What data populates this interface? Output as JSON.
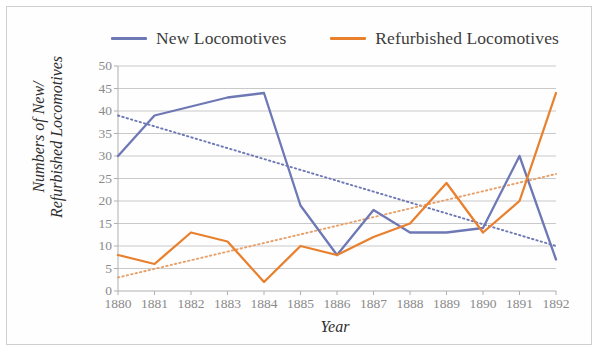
{
  "chart_data": {
    "type": "line",
    "title": "",
    "xlabel": "Year",
    "ylabel_line1": "Numbers of New/",
    "ylabel_line2": "Refurbished Locomotives",
    "categories": [
      "1880",
      "1881",
      "1882",
      "1883",
      "1884",
      "1885",
      "1886",
      "1887",
      "1888",
      "1889",
      "1890",
      "1891",
      "1892"
    ],
    "x": [
      1880,
      1881,
      1882,
      1883,
      1884,
      1885,
      1886,
      1887,
      1888,
      1889,
      1890,
      1891,
      1892
    ],
    "xlim": [
      1880,
      1892
    ],
    "ylim": [
      0,
      50
    ],
    "yticks": [
      0,
      5,
      10,
      15,
      20,
      25,
      30,
      35,
      40,
      45,
      50
    ],
    "ytick_labels": [
      "0",
      "5",
      "10",
      "15",
      "20",
      "25",
      "30",
      "35",
      "40",
      "45",
      "50"
    ],
    "grid": "horizontal",
    "legend_position": "top-center",
    "series": [
      {
        "name": "New Locomotives",
        "color": "#6d78b5",
        "style": "solid",
        "values": [
          30,
          39,
          41,
          43,
          44,
          19,
          8,
          18,
          13,
          13,
          14,
          30,
          7
        ]
      },
      {
        "name": "Refurbished Locomotives",
        "color": "#e8802e",
        "style": "solid",
        "values": [
          8,
          6,
          13,
          11,
          2,
          10,
          8,
          12,
          15,
          24,
          13,
          20,
          44
        ]
      }
    ],
    "trendlines": [
      {
        "name": "New Locomotives trend",
        "color": "#6d78b5",
        "style": "dotted",
        "from": [
          1880,
          39
        ],
        "to": [
          1892,
          10
        ]
      },
      {
        "name": "Refurbished Locomotives trend",
        "color": "#e8a06a",
        "style": "dotted",
        "from": [
          1880,
          3
        ],
        "to": [
          1892,
          26
        ]
      }
    ]
  },
  "legend": {
    "items": [
      {
        "label": "New Locomotives",
        "color": "#6d78b5"
      },
      {
        "label": "Refurbished Locomotives",
        "color": "#e8802e"
      }
    ]
  },
  "axes": {
    "x_title": "Year",
    "y_title_line1": "Numbers of New/",
    "y_title_line2": "Refurbished Locomotives"
  },
  "colors": {
    "series_new": "#6d78b5",
    "series_refurbished": "#e8802e",
    "trend_new": "#7b84b5",
    "trend_refurbished": "#e9a775",
    "gridline": "#c9c9c9",
    "axis": "#b0b0b0",
    "tick_text": "#8a8a8a",
    "background": "#ffffff",
    "border": "#cfcfcf"
  }
}
